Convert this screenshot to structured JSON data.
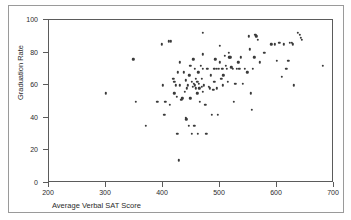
{
  "chart_data": {
    "type": "scatter",
    "title": "",
    "subtitle": "",
    "xlabel": "Average Verbal SAT Score",
    "ylabel": "Graduation Rate",
    "xlim": [
      200,
      700
    ],
    "ylim": [
      0,
      100
    ],
    "xticks": [
      200,
      300,
      400,
      500,
      600,
      700
    ],
    "yticks": [
      0,
      20,
      40,
      60,
      80,
      100
    ],
    "grid": false,
    "legend": null,
    "marker_color": "#3a3a3a",
    "frame_color": "#5b5b5b",
    "annotations": [],
    "points": [
      [
        300,
        55
      ],
      [
        348,
        76
      ],
      [
        352,
        50
      ],
      [
        370,
        35
      ],
      [
        390,
        50
      ],
      [
        398,
        85
      ],
      [
        400,
        60
      ],
      [
        402,
        42
      ],
      [
        404,
        50
      ],
      [
        410,
        87
      ],
      [
        412,
        48
      ],
      [
        414,
        87
      ],
      [
        418,
        64
      ],
      [
        420,
        62
      ],
      [
        420,
        55
      ],
      [
        422,
        60
      ],
      [
        424,
        53
      ],
      [
        425,
        30
      ],
      [
        426,
        68
      ],
      [
        428,
        14
      ],
      [
        430,
        74
      ],
      [
        430,
        60
      ],
      [
        432,
        51
      ],
      [
        434,
        52
      ],
      [
        436,
        68
      ],
      [
        438,
        56
      ],
      [
        440,
        63
      ],
      [
        440,
        40
      ],
      [
        441,
        39
      ],
      [
        442,
        58
      ],
      [
        444,
        60
      ],
      [
        445,
        35
      ],
      [
        446,
        66
      ],
      [
        448,
        72
      ],
      [
        448,
        52
      ],
      [
        450,
        62
      ],
      [
        450,
        30
      ],
      [
        452,
        59
      ],
      [
        453,
        76
      ],
      [
        454,
        61
      ],
      [
        455,
        35
      ],
      [
        456,
        70
      ],
      [
        456,
        60
      ],
      [
        458,
        64
      ],
      [
        458,
        58
      ],
      [
        460,
        62
      ],
      [
        460,
        55
      ],
      [
        461,
        30
      ],
      [
        462,
        68
      ],
      [
        463,
        61
      ],
      [
        464,
        58
      ],
      [
        465,
        50
      ],
      [
        466,
        72
      ],
      [
        468,
        64
      ],
      [
        468,
        59
      ],
      [
        470,
        92
      ],
      [
        470,
        79
      ],
      [
        470,
        70
      ],
      [
        470,
        56
      ],
      [
        472,
        60
      ],
      [
        474,
        48
      ],
      [
        476,
        30
      ],
      [
        478,
        70
      ],
      [
        480,
        59
      ],
      [
        482,
        58
      ],
      [
        484,
        66
      ],
      [
        486,
        42
      ],
      [
        488,
        57
      ],
      [
        490,
        70
      ],
      [
        490,
        62
      ],
      [
        492,
        76
      ],
      [
        494,
        70
      ],
      [
        494,
        58
      ],
      [
        496,
        42
      ],
      [
        498,
        70
      ],
      [
        500,
        84
      ],
      [
        500,
        74
      ],
      [
        502,
        64
      ],
      [
        504,
        70
      ],
      [
        505,
        60
      ],
      [
        506,
        66
      ],
      [
        508,
        78
      ],
      [
        510,
        72
      ],
      [
        512,
        70
      ],
      [
        514,
        62
      ],
      [
        515,
        80
      ],
      [
        516,
        77
      ],
      [
        518,
        77
      ],
      [
        520,
        71
      ],
      [
        522,
        70
      ],
      [
        524,
        50
      ],
      [
        526,
        61
      ],
      [
        528,
        61
      ],
      [
        530,
        70
      ],
      [
        532,
        74
      ],
      [
        534,
        70
      ],
      [
        536,
        77
      ],
      [
        540,
        61
      ],
      [
        544,
        70
      ],
      [
        548,
        68
      ],
      [
        550,
        90
      ],
      [
        552,
        82
      ],
      [
        554,
        55
      ],
      [
        556,
        45
      ],
      [
        558,
        70
      ],
      [
        560,
        77
      ],
      [
        562,
        91
      ],
      [
        564,
        90
      ],
      [
        566,
        88
      ],
      [
        570,
        74
      ],
      [
        578,
        80
      ],
      [
        590,
        85
      ],
      [
        596,
        85
      ],
      [
        600,
        75
      ],
      [
        604,
        86
      ],
      [
        608,
        65
      ],
      [
        612,
        85
      ],
      [
        616,
        70
      ],
      [
        620,
        75
      ],
      [
        622,
        86
      ],
      [
        626,
        86
      ],
      [
        628,
        85
      ],
      [
        630,
        60
      ],
      [
        636,
        92
      ],
      [
        640,
        91
      ],
      [
        642,
        89
      ],
      [
        644,
        88
      ],
      [
        680,
        72
      ]
    ]
  },
  "axes": {
    "x_title": "Average Verbal SAT Score",
    "y_title": "Graduation Rate",
    "x_tick_labels": [
      "200",
      "300",
      "400",
      "500",
      "600",
      "700"
    ],
    "y_tick_labels": [
      "0",
      "20",
      "40",
      "60",
      "80",
      "100"
    ]
  }
}
